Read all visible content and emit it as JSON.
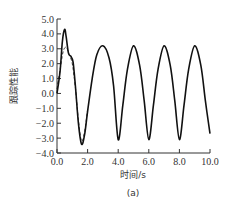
{
  "chart_data": {
    "type": "line",
    "title": "",
    "xlabel": "时间/s",
    "ylabel": "跟踪性能",
    "caption": "(a)",
    "xlim": [
      0.0,
      10.0
    ],
    "ylim": [
      -4.0,
      5.0
    ],
    "xticks": [
      "0.0",
      "2.0",
      "4.0",
      "6.0",
      "8.0",
      "10.0"
    ],
    "yticks": [
      "5.0",
      "4.0",
      "3.0",
      "2.0",
      "1.0",
      "0.0",
      "-1.0",
      "-2.0",
      "-3.0",
      "-4.0"
    ],
    "grid": false,
    "series": [
      {
        "name": "actual",
        "style": "solid",
        "x": [
          0.0,
          0.2,
          0.35,
          0.5,
          0.6,
          0.75,
          0.9,
          1.05,
          1.2,
          1.4,
          1.6,
          1.8,
          2.0,
          2.3,
          2.6,
          3.0,
          3.4,
          3.7,
          4.0,
          4.3,
          4.6,
          5.0,
          5.4,
          5.7,
          6.0,
          6.3,
          6.6,
          7.0,
          7.4,
          7.7,
          8.0,
          8.3,
          8.6,
          9.0,
          9.4,
          9.7,
          10.0
        ],
        "values": [
          0.0,
          1.5,
          3.5,
          4.3,
          3.8,
          2.7,
          2.5,
          2.1,
          0.5,
          -2.0,
          -3.4,
          -2.8,
          -1.2,
          1.0,
          2.6,
          3.2,
          2.4,
          0.5,
          -3.1,
          -0.8,
          1.6,
          3.2,
          1.9,
          -0.5,
          -3.1,
          -0.8,
          1.6,
          3.2,
          1.9,
          -0.5,
          -3.1,
          -0.8,
          1.6,
          3.2,
          1.9,
          -0.5,
          -2.7
        ]
      },
      {
        "name": "reference",
        "style": "dashed",
        "x": [
          0.0,
          0.2,
          0.4,
          0.6,
          0.8,
          1.0,
          1.2,
          1.4,
          1.6,
          1.8,
          2.0
        ],
        "values": [
          0.3,
          1.6,
          2.8,
          3.1,
          2.6,
          2.0,
          0.4,
          -1.8,
          -3.2,
          -2.6,
          -1.1
        ]
      }
    ]
  }
}
